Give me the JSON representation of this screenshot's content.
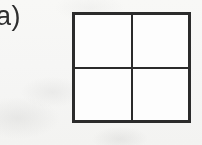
{
  "figure": {
    "panel_label": "a)",
    "background_color": "#fbfbfa",
    "ink_color": "#2b2b2b",
    "label_color": "#2e2e2e"
  },
  "grid": {
    "rows": 2,
    "columns": 2,
    "cell_count": 4,
    "outer_border_px": 3,
    "divider_px": 3,
    "cells": [
      {
        "id": "r0c0",
        "row": 0,
        "column": 0,
        "content": ""
      },
      {
        "id": "r0c1",
        "row": 0,
        "column": 1,
        "content": ""
      },
      {
        "id": "r1c0",
        "row": 1,
        "column": 0,
        "content": ""
      },
      {
        "id": "r1c1",
        "row": 1,
        "column": 1,
        "content": ""
      }
    ]
  }
}
